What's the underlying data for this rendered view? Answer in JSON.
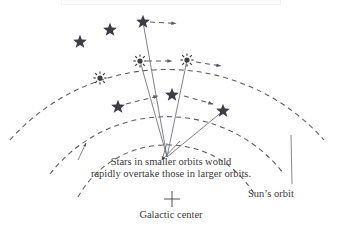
{
  "figure": {
    "title_hidden": "",
    "background_color": "#ffffff",
    "ink_color": "#4a4a4a",
    "star_color": "#3d3d45",
    "caption": {
      "line_1": "Stars in smaller orbits would",
      "line_2": "rapidly overtake those in larger orbits."
    },
    "labels": {
      "sun_orbit": "Sun’s orbit",
      "galactic_center": "Galactic center"
    },
    "markers": {
      "galactic_center_symbol": "plus-cross-marker"
    },
    "orbits": [
      {
        "name": "outer-orbit",
        "style": "dashed-arc-with-arrowheads",
        "radius": 210,
        "star_symbol": "five-pointed-star",
        "star_count": 3,
        "stars": [
          {
            "x": 80,
            "y": 42
          },
          {
            "x": 110,
            "y": 30
          },
          {
            "x": 143,
            "y": 22
          }
        ]
      },
      {
        "name": "middle-orbit-suns-orbit",
        "style": "dashed-arc-with-arrowheads",
        "radius": 148,
        "star_symbol": "sunburst-star",
        "star_count": 3,
        "stars": [
          {
            "x": 100,
            "y": 78
          },
          {
            "x": 140,
            "y": 61
          },
          {
            "x": 187,
            "y": 60
          }
        ]
      },
      {
        "name": "inner-orbit",
        "style": "dashed-arc-with-arrowheads",
        "radius": 102,
        "star_symbol": "five-pointed-star",
        "star_count": 3,
        "stars": [
          {
            "x": 118,
            "y": 107
          },
          {
            "x": 172,
            "y": 95
          },
          {
            "x": 223,
            "y": 111
          }
        ]
      }
    ],
    "radial_lines": {
      "name": "radial-lines-from-center",
      "vertex": {
        "x": 167,
        "y": 157
      },
      "count": 3
    }
  }
}
